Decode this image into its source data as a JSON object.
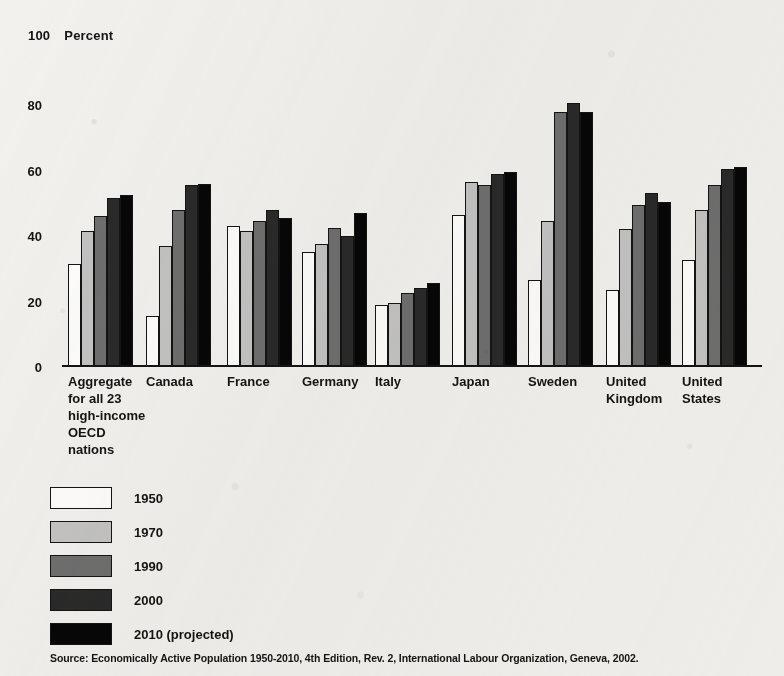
{
  "chart_data": {
    "type": "bar",
    "axis_max_label": "100",
    "unit_label": "Percent",
    "xlabel": "",
    "ylabel": "Percent",
    "ylim": [
      0,
      100
    ],
    "yticks": [
      0,
      20,
      40,
      60,
      80,
      100
    ],
    "ytick_labels": [
      "0",
      "20",
      "40",
      "60",
      "80",
      "100"
    ],
    "grid": false,
    "legend_position": "below-plot-left",
    "categories": [
      "Aggregate\nfor all 23\nhigh-income\nOECD\nnations",
      "Canada",
      "France",
      "Germany",
      "Italy",
      "Japan",
      "Sweden",
      "United\nKingdom",
      "United\nStates"
    ],
    "series": [
      {
        "name": "1950",
        "color": "#fdfdfc",
        "values": [
          31,
          15,
          42.5,
          34.5,
          18.5,
          46,
          26,
          23,
          32
        ]
      },
      {
        "name": "1970",
        "color": "#c3c3c3",
        "values": [
          41,
          36.5,
          41,
          37,
          19,
          56,
          44,
          41.5,
          47.5
        ]
      },
      {
        "name": "1990",
        "color": "#6f6f6f",
        "values": [
          45.5,
          47.5,
          44,
          42,
          22,
          55,
          77.5,
          49,
          55
        ]
      },
      {
        "name": "2000",
        "color": "#2a2a2a",
        "values": [
          51,
          55,
          47.5,
          39.5,
          23.5,
          58.5,
          80,
          52.5,
          60
        ]
      },
      {
        "name": "2010 (projected)",
        "color": "#070707",
        "values": [
          52,
          55.5,
          45,
          46.5,
          25,
          59,
          77.5,
          50,
          60.5
        ]
      }
    ],
    "source": "Source:  Economically Active Population 1950-2010, 4th Edition, Rev. 2, International Labour Organization, Geneva, 2002."
  }
}
